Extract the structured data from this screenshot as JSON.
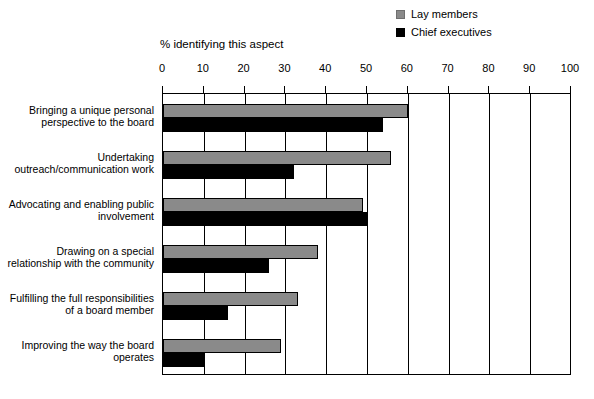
{
  "chart_data": {
    "type": "bar",
    "orientation": "horizontal",
    "title": "% identifying this aspect",
    "xlabel": "",
    "ylabel": "",
    "xlim": [
      0,
      100
    ],
    "xticks": [
      0,
      10,
      20,
      30,
      40,
      50,
      60,
      70,
      80,
      90,
      100
    ],
    "grid": true,
    "legend_position": "top-right",
    "categories": [
      "Bringing a unique personal perspective to the board",
      "Undertaking outreach/communication work",
      "Advocating and enabling public involvement",
      "Drawing on a special relationship with the community",
      "Fulfilling the full responsibilities of a board member",
      "Improving the way the board operates"
    ],
    "series": [
      {
        "name": "Lay members",
        "color": "#8a8a8a",
        "values": [
          60,
          56,
          49,
          38,
          33,
          29
        ]
      },
      {
        "name": "Chief executives",
        "color": "#000000",
        "values": [
          54,
          32,
          50,
          26,
          16,
          10
        ]
      }
    ]
  },
  "legend": {
    "items": [
      {
        "label": "Lay members",
        "swatch": "gray-swatch-icon"
      },
      {
        "label": "Chief executives",
        "swatch": "black-swatch-icon"
      }
    ]
  }
}
